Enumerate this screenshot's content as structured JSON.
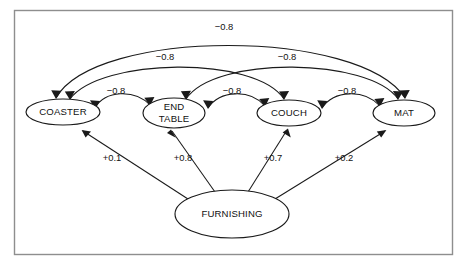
{
  "figure": {
    "background_color": "#ffffff",
    "frame_color": "#8e8e8e",
    "stroke_color": "#1a1a1a",
    "text_color": "#111111"
  },
  "nodes": [
    {
      "id": "coaster",
      "label": "COASTER",
      "label_line1": "COASTER",
      "label_line2": "",
      "cx": 63,
      "cy": 112,
      "rx": 37,
      "ry": 13
    },
    {
      "id": "end_table",
      "label": "END TABLE",
      "label_line1": "END",
      "label_line2": "TABLE",
      "cx": 174,
      "cy": 113,
      "rx": 31,
      "ry": 15
    },
    {
      "id": "couch",
      "label": "COUCH",
      "label_line1": "COUCH",
      "label_line2": "",
      "cx": 289,
      "cy": 113,
      "rx": 32,
      "ry": 13
    },
    {
      "id": "mat",
      "label": "MAT",
      "label_line1": "MAT",
      "label_line2": "",
      "cx": 404,
      "cy": 113,
      "rx": 31,
      "ry": 13
    },
    {
      "id": "furnishing",
      "label": "FURNISHING",
      "label_line1": "FURNISHING",
      "label_line2": "",
      "cx": 232,
      "cy": 214,
      "rx": 57,
      "ry": 24
    }
  ],
  "edges": [
    {
      "id": "coaster-end_table",
      "from": "coaster",
      "to": "end_table",
      "label": "−0.8",
      "label_x": 116,
      "label_y": 92,
      "sign": "negative",
      "kind": "bidirectional-arc"
    },
    {
      "id": "end_table-couch",
      "from": "end_table",
      "to": "couch",
      "label": "−0.8",
      "label_x": 232,
      "label_y": 92,
      "sign": "negative",
      "kind": "bidirectional-arc"
    },
    {
      "id": "couch-mat",
      "from": "couch",
      "to": "mat",
      "label": "−0.8",
      "label_x": 347,
      "label_y": 92,
      "sign": "negative",
      "kind": "bidirectional-arc"
    },
    {
      "id": "coaster-couch",
      "from": "coaster",
      "to": "couch",
      "label": "−0.8",
      "label_x": 165,
      "label_y": 58,
      "sign": "negative",
      "kind": "bidirectional-arc"
    },
    {
      "id": "end_table-mat",
      "from": "end_table",
      "to": "mat",
      "label": "−0.8",
      "label_x": 287,
      "label_y": 58,
      "sign": "negative",
      "kind": "bidirectional-arc"
    },
    {
      "id": "coaster-mat",
      "from": "coaster",
      "to": "mat",
      "label": "−0.8",
      "label_x": 224,
      "label_y": 28,
      "sign": "negative",
      "kind": "bidirectional-arc"
    },
    {
      "id": "furnishing-coaster",
      "from": "furnishing",
      "to": "coaster",
      "label": "+0.1",
      "label_x": 112,
      "label_y": 159,
      "sign": "positive",
      "kind": "straight-arrow"
    },
    {
      "id": "furnishing-end_table",
      "from": "furnishing",
      "to": "end_table",
      "label": "+0.8",
      "label_x": 183,
      "label_y": 159,
      "sign": "positive",
      "kind": "straight-arrow"
    },
    {
      "id": "furnishing-couch",
      "from": "furnishing",
      "to": "couch",
      "label": "+0.7",
      "label_x": 273,
      "label_y": 159,
      "sign": "positive",
      "kind": "straight-arrow"
    },
    {
      "id": "furnishing-mat",
      "from": "furnishing",
      "to": "mat",
      "label": "+0.2",
      "label_x": 344,
      "label_y": 159,
      "sign": "positive",
      "kind": "straight-arrow"
    }
  ]
}
